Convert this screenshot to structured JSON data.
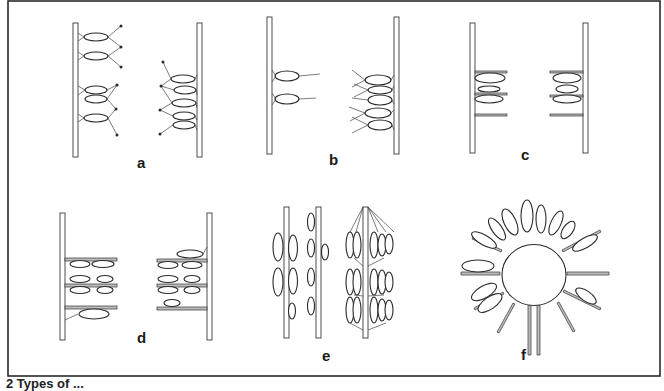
{
  "figure": {
    "type": "scientific line illustration",
    "panels": [
      {
        "id": "a",
        "label": "a"
      },
      {
        "id": "b",
        "label": "b"
      },
      {
        "id": "c",
        "label": "c"
      },
      {
        "id": "d",
        "label": "d"
      },
      {
        "id": "e",
        "label": "e"
      },
      {
        "id": "f",
        "label": "f"
      }
    ],
    "caption": "2   Types of ..."
  },
  "colors": {
    "line": "#2a2a2a",
    "background": "#ffffff",
    "plate": "#bdbdbd"
  }
}
